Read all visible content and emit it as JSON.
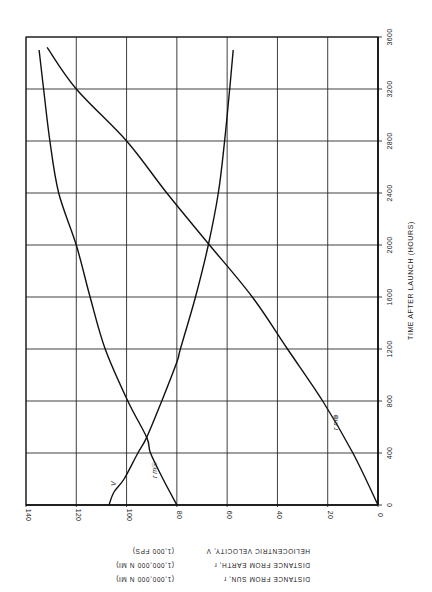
{
  "chart_data": {
    "type": "line",
    "orientation_note": "Page printed rotated 90 degrees; time axis runs vertically along right edge",
    "title": "",
    "xlabel": "TIME AFTER LAUNCH (HOURS)",
    "ylabel_lines": [
      {
        "text": "HELIOCENTRIC VELOCITY, V",
        "unit": "(1,000 FPS)"
      },
      {
        "text": "DISTANCE FROM EARTH, r_m⊕",
        "unit": "(1,000,000 N MI)"
      },
      {
        "text": "DISTANCE FROM SUN, r_m☉",
        "unit": "(1,000,000 N MI)"
      }
    ],
    "x_ticks": [
      0,
      400,
      800,
      1200,
      1600,
      2000,
      2400,
      2800,
      3200,
      3600
    ],
    "y_ticks": [
      0,
      20,
      40,
      60,
      80,
      100,
      120,
      140
    ],
    "xlim": [
      0,
      3600
    ],
    "ylim": [
      0,
      140
    ],
    "grid": true,
    "series": [
      {
        "name": "V",
        "label": "V",
        "description": "Heliocentric velocity (1,000 fps)",
        "x": [
          0,
          100,
          200,
          400,
          520,
          800,
          1100,
          1200,
          1600,
          2000,
          2400,
          2800,
          3200,
          3500
        ],
        "values": [
          107,
          105,
          101,
          95.5,
          92,
          86,
          80,
          78.6,
          72.6,
          67.5,
          63.5,
          61,
          59,
          57.6
        ]
      },
      {
        "name": "r_m☉",
        "label": "r m☉",
        "description": "Distance from Sun (1,000,000 n mi)",
        "x": [
          0,
          200,
          400,
          520,
          800,
          1200,
          1600,
          2000,
          2400,
          2800,
          3200,
          3500
        ],
        "values": [
          80,
          85.5,
          90.5,
          92,
          99.5,
          108.5,
          114.5,
          120,
          127,
          130.5,
          133,
          134.8
        ]
      },
      {
        "name": "r_m⊕",
        "label": "r m⊕",
        "description": "Distance from Earth (1,000,000 n mi)",
        "x": [
          0,
          400,
          800,
          1200,
          1600,
          2000,
          2400,
          2800,
          3200,
          3520
        ],
        "values": [
          0,
          10,
          22,
          36,
          50,
          67,
          84,
          100,
          120,
          131.6
        ]
      }
    ],
    "annotations": [
      {
        "text": "V",
        "near_series": "V",
        "at_x": 200
      },
      {
        "text": "r m☉",
        "near_series": "r_m☉",
        "at_x": 250
      },
      {
        "text": "r m⊕",
        "near_series": "r_m⊕",
        "at_x": 600
      }
    ]
  },
  "labels": {
    "x_title": "TIME AFTER LAUNCH    (HOURS)",
    "y_line1_left": "HELIOCENTRIC VELOCITY, V",
    "y_line1_right": "(1,000          FPS)",
    "y_line2_left": "DISTANCE FROM EARTH, r",
    "y_line2_right": "(1,000,000  N MI)",
    "y_line3_left": "DISTANCE FROM SUN, r",
    "y_line3_right": "(1,000,000  N MI)",
    "sub_earth": "m⊕",
    "sub_sun": "m☉",
    "curve_v": "V",
    "curve_sun": "r m☉",
    "curve_earth": "r m⊕"
  }
}
